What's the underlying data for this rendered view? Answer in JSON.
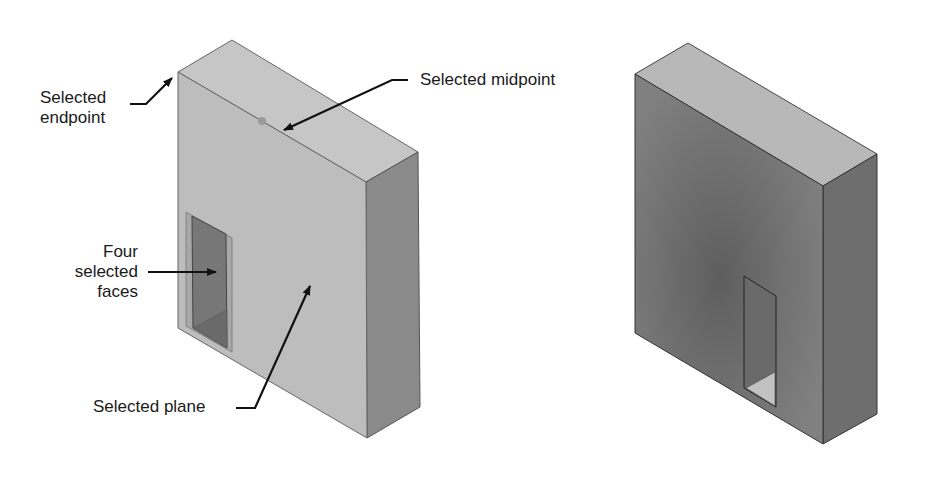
{
  "figure": {
    "left_object": {
      "name": "Block with rectangular pocket (selected geometry highlighted)",
      "colors": {
        "front": "#bdbdbd",
        "top": "#c6c6c6",
        "side": "#8a8a8a",
        "hole": "#777777",
        "edge": "#555555",
        "selected_point": "#9a9a9a"
      }
    },
    "right_object": {
      "name": "Block with through-slot (unselected, shaded)",
      "colors": {
        "front": "#7a7a7a",
        "top": "#b8b8b8",
        "side": "#6e6e6e",
        "hole_floor": "#c2c2c2",
        "edge": "#333333"
      }
    },
    "callouts": {
      "endpoint": {
        "line1": "Selected",
        "line2": "endpoint"
      },
      "midpoint": {
        "text": "Selected midpoint"
      },
      "faces": {
        "line1": "Four",
        "line2": "selected",
        "line3": "faces"
      },
      "plane": {
        "text": "Selected plane"
      }
    }
  }
}
